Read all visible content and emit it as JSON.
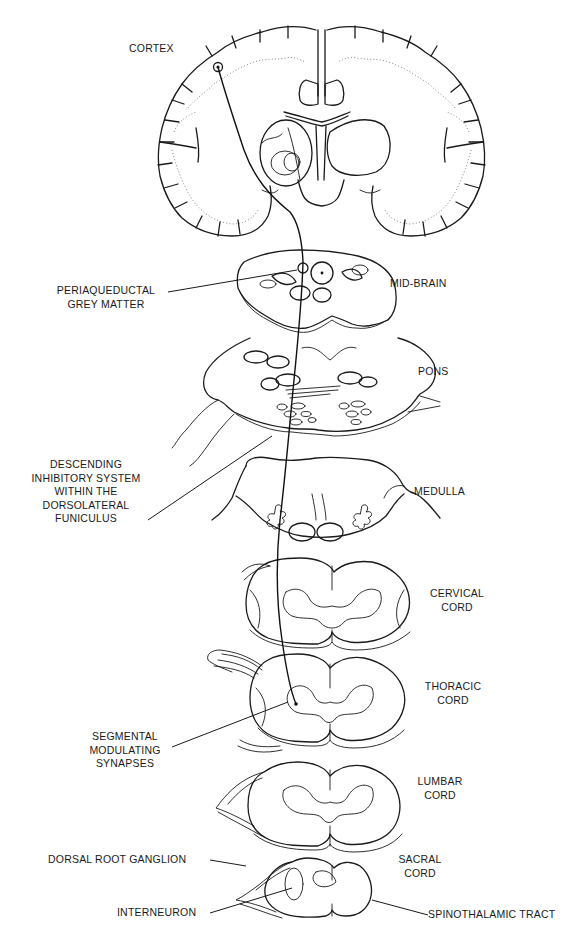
{
  "figure": {
    "colors": {
      "ink": "#1a1a1a",
      "background": "#ffffff",
      "dotted_grey": "#777777"
    },
    "sections": [
      {
        "id": "cortex",
        "label": "CORTEX"
      },
      {
        "id": "mid-brain",
        "label": "MID-BRAIN"
      },
      {
        "id": "pons",
        "label": "PONS"
      },
      {
        "id": "medulla",
        "label": "MEDULLA"
      },
      {
        "id": "cervical-cord",
        "label_lines": [
          "CERVICAL",
          "CORD"
        ]
      },
      {
        "id": "thoracic-cord",
        "label_lines": [
          "THORACIC",
          "CORD"
        ]
      },
      {
        "id": "lumbar-cord",
        "label_lines": [
          "LUMBAR",
          "CORD"
        ]
      },
      {
        "id": "sacral-cord",
        "label_lines": [
          "SACRAL",
          "CORD"
        ]
      }
    ],
    "annotations": {
      "periaqueductal": [
        "PERIAQUEDUCTAL",
        "GREY MATTER"
      ],
      "descending": [
        "DESCENDING",
        "INHIBITORY SYSTEM",
        "WITHIN THE",
        "DORSOLATERAL",
        "FUNICULUS"
      ],
      "segmental": [
        "SEGMENTAL",
        "MODULATING",
        "SYNAPSES"
      ],
      "dorsal_root_ganglion": "DORSAL ROOT GANGLION",
      "interneuron": "INTERNEURON",
      "spinothalamic_tract": "SPINOTHALAMIC TRACT"
    }
  }
}
